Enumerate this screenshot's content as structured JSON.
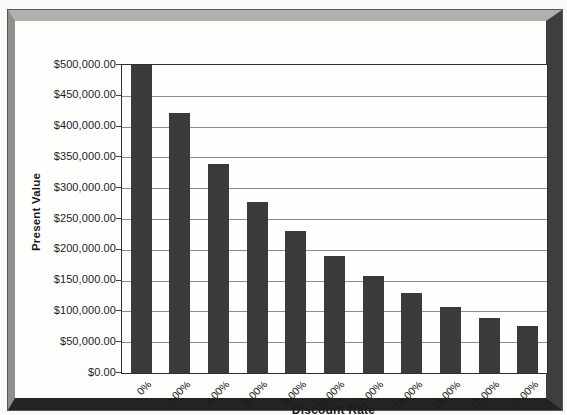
{
  "figure": {
    "background": "#fafaf8",
    "inner_background": "#fefefd",
    "frame_colors": {
      "top": "#b1b0ad",
      "left": "#908f8c",
      "right": "#3f3e3c",
      "bottom": "#232322",
      "edge": "#565656"
    }
  },
  "chart_data": {
    "type": "bar",
    "title": "",
    "xlabel": "Discount Rate",
    "ylabel": "Present Value",
    "categories": [
      "0%",
      "2.00%",
      "4.00%",
      "6.00%",
      "8.00%",
      "10.00%",
      "12.00%",
      "14.00%",
      "16.00%",
      "18.00%",
      "20.00%"
    ],
    "values": [
      500000,
      422000,
      340000,
      277000,
      230000,
      190000,
      157000,
      130000,
      107000,
      89000,
      76000
    ],
    "y_tick_labels": [
      "$500,000.00",
      "$450,000.00",
      "$400,000.00",
      "$350,000.00",
      "$300,000.00",
      "$250,000.00",
      "$200,000.00",
      "$150,000.00",
      "$100,000.00",
      "$50,000.00",
      "$0.00"
    ],
    "ylim": [
      0,
      500000
    ],
    "y_tick_step": 50000,
    "grid": true,
    "legend": "none",
    "bar_color": "#3a3a3a",
    "gridline_color": "#8c8c8c"
  }
}
